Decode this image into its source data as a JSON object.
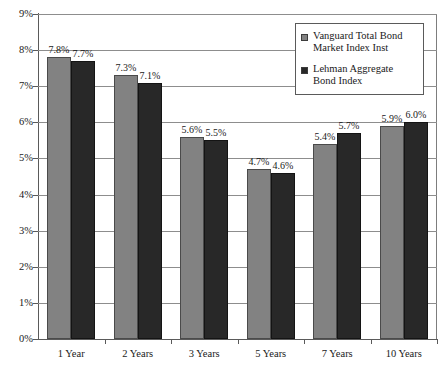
{
  "chart_data": {
    "type": "bar",
    "title": "",
    "subtitle": "",
    "xlabel": "",
    "ylabel": "",
    "categories": [
      "1 Year",
      "2 Years",
      "3 Years",
      "5 Years",
      "7 Years",
      "10 Years"
    ],
    "series": [
      {
        "name": "Vanguard Total Bond Market Index Inst",
        "color": "#828282",
        "values": [
          7.8,
          7.3,
          5.6,
          4.7,
          5.4,
          5.9
        ],
        "labels": [
          "7.8%",
          "7.3%",
          "5.6%",
          "4.7%",
          "5.4%",
          "5.9%"
        ]
      },
      {
        "name": "Lehman Aggregate Bond Index",
        "color": "#282828",
        "values": [
          7.7,
          7.1,
          5.5,
          4.6,
          5.7,
          6.0
        ],
        "labels": [
          "7.7%",
          "7.1%",
          "5.5%",
          "4.6%",
          "5.7%",
          "6.0%"
        ]
      }
    ],
    "ylim": [
      0,
      9
    ],
    "ytick_values": [
      0,
      1,
      2,
      3,
      4,
      5,
      6,
      7,
      8,
      9
    ],
    "ytick_labels": [
      "0%",
      "1%",
      "2%",
      "3%",
      "4%",
      "5%",
      "6%",
      "7%",
      "8%",
      "9%"
    ],
    "grid": true,
    "legend_position": "top-right",
    "value_labels": true
  },
  "legend": {
    "entries": [
      {
        "label": "Vanguard Total Bond Market Index Inst",
        "color": "#828282"
      },
      {
        "label": "Lehman Aggregate Bond Index",
        "color": "#282828"
      }
    ]
  }
}
